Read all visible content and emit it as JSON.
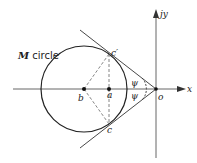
{
  "diagram": {
    "title_label": {
      "italic": "M",
      "rest": " circle"
    },
    "axes": {
      "x_label": "x",
      "y_label": "jy",
      "origin_label": "o"
    },
    "points": {
      "b": "b",
      "a": "a",
      "c_prime": "c′",
      "c": "c"
    },
    "angles": {
      "upper": "ψ",
      "lower": "ψ"
    },
    "colors": {
      "line": "#222222",
      "axis": "#555555",
      "dashed": "#666666",
      "background": "#ffffff"
    }
  }
}
